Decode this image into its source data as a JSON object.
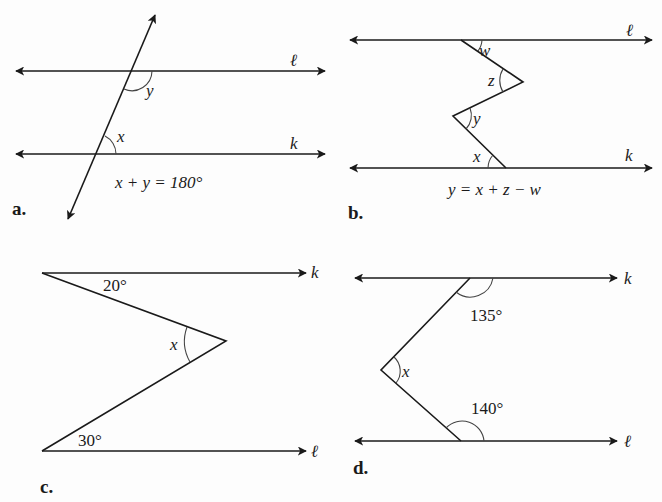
{
  "figures": [
    {
      "panel_label": "a.",
      "lines": {
        "top": "ℓ",
        "bottom": "k"
      },
      "angles": [
        "y",
        "x"
      ],
      "equation": "x + y = 180°"
    },
    {
      "panel_label": "b.",
      "lines": {
        "top": "ℓ",
        "bottom": "k"
      },
      "angles": [
        "w",
        "z",
        "y",
        "x"
      ],
      "equation": "y = x + z − w"
    },
    {
      "panel_label": "c.",
      "lines": {
        "top": "k",
        "bottom": "ℓ"
      },
      "angles": [
        "20°",
        "x",
        "30°"
      ]
    },
    {
      "panel_label": "d.",
      "lines": {
        "top": "k",
        "bottom": "ℓ"
      },
      "angles": [
        "135°",
        "x",
        "140°"
      ]
    }
  ],
  "colors": {
    "ink": "#1a1a1a",
    "background": "#fdfdfd"
  }
}
